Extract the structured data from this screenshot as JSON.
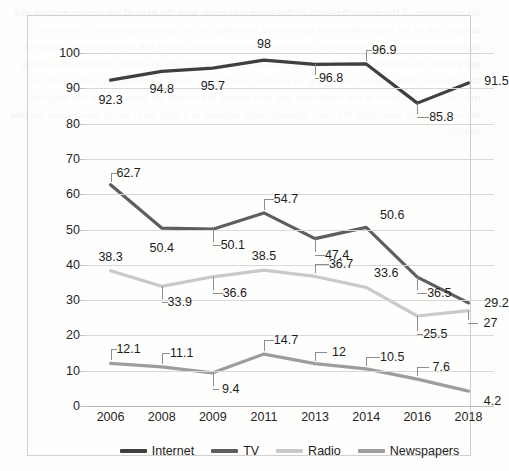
{
  "chart_data": {
    "type": "line",
    "title": "",
    "subtitle": "",
    "xlabel": "",
    "ylabel": "",
    "categories": [
      "2006",
      "2008",
      "2009",
      "2011",
      "2013",
      "2014",
      "2016",
      "2018"
    ],
    "ylim": [
      0,
      100
    ],
    "yticks": [
      0,
      10,
      20,
      30,
      40,
      50,
      60,
      70,
      80,
      90,
      100
    ],
    "grid": true,
    "legend_position": "bottom",
    "series": [
      {
        "name": "Internet",
        "color": "#3f3f3f",
        "values": [
          92.3,
          94.8,
          95.7,
          98,
          96.8,
          96.9,
          85.8,
          91.5
        ],
        "labels": [
          "92.3",
          "94.8",
          "95.7",
          "98",
          "96.8",
          "96.9",
          "85.8",
          "91.5"
        ]
      },
      {
        "name": "TV",
        "color": "#5e5e5e",
        "values": [
          62.7,
          50.4,
          50.1,
          54.7,
          47.4,
          50.6,
          36.5,
          29.2
        ],
        "labels": [
          "62.7",
          "50.4",
          "50.1",
          "54.7",
          "47.4",
          "50.6",
          "36.5",
          "29.2"
        ]
      },
      {
        "name": "Radio",
        "color": "#c9c9c9",
        "values": [
          38.3,
          33.9,
          36.6,
          38.5,
          36.7,
          33.6,
          25.5,
          27
        ],
        "labels": [
          "38.3",
          "33.9",
          "36.6",
          "38.5",
          "36.7",
          "33.6",
          "25.5",
          "27"
        ]
      },
      {
        "name": "Newspapers",
        "color": "#9d9d9d",
        "values": [
          12.1,
          11.1,
          9.4,
          14.7,
          12,
          10.5,
          7.6,
          4.2
        ],
        "labels": [
          "12.1",
          "11.1",
          "9.4",
          "14.7",
          "12",
          "10.5",
          "7.6",
          "4.2"
        ]
      }
    ]
  },
  "legend": {
    "items": [
      {
        "label": "Internet"
      },
      {
        "label": "TV"
      },
      {
        "label": "Radio"
      },
      {
        "label": "Newspapers"
      }
    ]
  },
  "background": {
    "bleed_text": "the evaluation of the research results of the study was made with the help of the survey method. the sample size of the respondents was determined according to the general population. in order to ensure the reliability of the sample, the survey was conducted among the respondents of different age groups. the results obtained probably reflect the real tendencies of media consumption among the audience of the region, and allow us to draw conclusions about the dynamics of the level of trust of the population in the traditional and new media. the results are presented in the diagram below. as can be seen from the data, internet usage remains at a high level while newspapers decline steadily."
  }
}
